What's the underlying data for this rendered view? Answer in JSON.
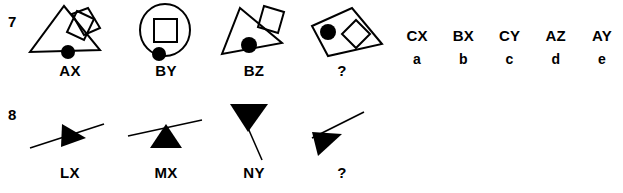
{
  "items": [
    {
      "number": "7",
      "figures": [
        {
          "label": "AX",
          "shape": "triangle-with-two-rhombi-and-dot"
        },
        {
          "label": "BY",
          "shape": "circle-with-square-and-dot"
        },
        {
          "label": "BZ",
          "shape": "tilted-triangle-with-square-and-dot"
        },
        {
          "label": "?",
          "shape": "parallelogram-with-rhombus-and-dot"
        }
      ],
      "options": [
        {
          "code": "CX",
          "key": "a"
        },
        {
          "code": "BX",
          "key": "b"
        },
        {
          "code": "CY",
          "key": "c"
        },
        {
          "code": "AZ",
          "key": "d"
        },
        {
          "code": "AY",
          "key": "e"
        }
      ]
    },
    {
      "number": "8",
      "figures": [
        {
          "label": "LX",
          "shape": "right-triangle-on-rising-line"
        },
        {
          "label": "MX",
          "shape": "up-triangle-under-rising-line"
        },
        {
          "label": "NY",
          "shape": "down-triangle-on-falling-line"
        },
        {
          "label": "?",
          "shape": "left-triangle-with-rising-line"
        }
      ],
      "options": [
        {
          "code": "LY",
          "key": "a"
        },
        {
          "code": "NZ",
          "key": "b"
        },
        {
          "code": "NX",
          "key": "c"
        },
        {
          "code": "MY",
          "key": "d"
        },
        {
          "code": "LZ",
          "key": "e"
        }
      ]
    }
  ],
  "colors": {
    "ink": "#000000",
    "paper": "#ffffff"
  }
}
